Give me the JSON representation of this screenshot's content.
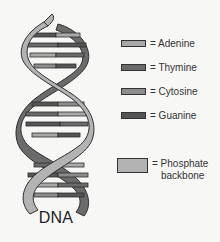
{
  "diagram": {
    "title": "DNA",
    "legend": [
      {
        "id": "adenine",
        "label": "= Adenine",
        "color": "#a9a9a9",
        "swatch": "pill"
      },
      {
        "id": "thymine",
        "label": "= Thymine",
        "color": "#6a6a6a",
        "swatch": "pill"
      },
      {
        "id": "cytosine",
        "label": "= Cytosine",
        "color": "#8c8c8c",
        "swatch": "pill"
      },
      {
        "id": "guanine",
        "label": "= Guanine",
        "color": "#555555",
        "swatch": "pill"
      },
      {
        "id": "phosphate-backbone",
        "label_line1": "= Phosphate",
        "label_line2": "backbone",
        "color": "#b3b3b3",
        "swatch": "box"
      }
    ],
    "colors": {
      "background": "#f7f7f5",
      "backbone_front": "#b3b3b3",
      "backbone_back": "#6b6b6b",
      "outline": "#2e2e2e",
      "adenine": "#a9a9a9",
      "thymine": "#6a6a6a",
      "cytosine": "#8c8c8c",
      "guanine": "#555555"
    }
  }
}
